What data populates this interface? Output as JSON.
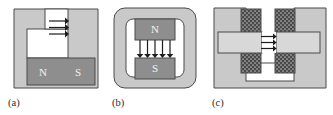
{
  "figure": {
    "type": "diagram",
    "background_color": "#ffffff",
    "panel_count": 3
  },
  "palette": {
    "yoke_fill": "#c9c9c9",
    "yoke_stroke": "#4a4a4a",
    "magnet_fill": "#8e8e8e",
    "magnet_stroke": "#4a4a4a",
    "coil_fill": "#4a4a4a",
    "coil_stipple": "#9a9a9a",
    "pole_fill": "#d8d8d8",
    "air_gap_fill": "#ffffff",
    "arrow_color": "#1c1c1c",
    "label_color": "#f2f2f2",
    "caption_color": "#2b2b2b",
    "page_background": "#ffffff"
  },
  "panels": [
    {
      "id": "a",
      "caption": "(a)",
      "caption_x": 8,
      "caption_y": 104,
      "frame": {
        "x": 14,
        "y": 9,
        "width": 84,
        "height": 79
      },
      "shape": "c-core-horizontal-gap",
      "magnet": {
        "orientation": "horizontal",
        "pole_labels": [
          "N",
          "S"
        ],
        "north_label": "N",
        "south_label": "S",
        "north_x": 43,
        "south_x": 78,
        "label_y": 72,
        "rect": {
          "x": 27,
          "y": 58,
          "width": 68,
          "height": 27
        }
      },
      "air_gap": {
        "orientation": "vertical-slot",
        "rect": {
          "x": 27,
          "y": 29,
          "width": 41,
          "height": 29
        }
      },
      "arrows": {
        "count": 3,
        "direction": "right",
        "start_x": 50,
        "end_x": 68,
        "ys": [
          22,
          28,
          34
        ],
        "label": "flux-arrows-right"
      }
    },
    {
      "id": "b",
      "caption": "(b)",
      "caption_x": 112,
      "caption_y": 104,
      "frame": {
        "x": 114,
        "y": 8,
        "width": 82,
        "height": 80
      },
      "shape": "rounded-square-ring-core",
      "magnet": {
        "orientation": "vertical",
        "pole_labels": [
          "N",
          "S"
        ],
        "north_label": "N",
        "south_label": "S",
        "north_rect": {
          "x": 135,
          "y": 23,
          "width": 40,
          "height": 21
        },
        "south_rect": {
          "x": 135,
          "y": 62,
          "width": 40,
          "height": 21
        },
        "north_label_x": 155,
        "north_label_y": 35,
        "south_label_x": 155,
        "south_label_y": 75
      },
      "air_gap": {
        "orientation": "horizontal-slot",
        "rect": {
          "x": 135,
          "y": 44,
          "width": 40,
          "height": 18
        }
      },
      "arrows": {
        "count": 5,
        "direction": "down",
        "start_y": 44,
        "end_y": 61,
        "xs": [
          140,
          147,
          154,
          161,
          168
        ],
        "label": "flux-arrows-down"
      }
    },
    {
      "id": "c",
      "caption": "(c)",
      "caption_x": 212,
      "caption_y": 104,
      "frame": {
        "x": 214,
        "y": 8,
        "width": 112,
        "height": 80
      },
      "shape": "u-yoke-with-two-wound-limbs",
      "coils": {
        "count": 2,
        "texture": "stipple",
        "left_upper": {
          "x": 241,
          "y": 11,
          "width": 20,
          "height": 26
        },
        "left_lower": {
          "x": 241,
          "y": 48,
          "width": 20,
          "height": 26
        },
        "right_upper": {
          "x": 275,
          "y": 11,
          "width": 20,
          "height": 26
        },
        "right_lower": {
          "x": 275,
          "y": 48,
          "width": 20,
          "height": 26
        }
      },
      "pole_pieces": {
        "left": {
          "x": 218,
          "y": 32,
          "width": 44,
          "height": 20
        },
        "right": {
          "x": 276,
          "y": 32,
          "width": 44,
          "height": 20
        }
      },
      "air_gap": {
        "orientation": "horizontal-central",
        "rect": {
          "x": 262,
          "y": 32,
          "width": 14,
          "height": 20
        }
      },
      "arrows": {
        "count": 3,
        "direction": "right",
        "start_x": 262,
        "end_x": 277,
        "ys": [
          36,
          42,
          48
        ],
        "label": "flux-arrows-right"
      }
    }
  ]
}
